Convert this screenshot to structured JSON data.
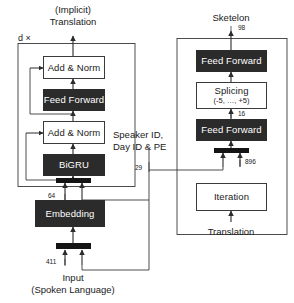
{
  "figure": {
    "background_color": "#ffffff",
    "dark_block_color": "#2b2b2b",
    "light_block_color": "#ffffff",
    "line_color": "#3a3a3a"
  },
  "left_branch": {
    "output_caption_line1": "(Implicit)",
    "output_caption_line2": "Translation",
    "repeat_caption": "d ×",
    "blocks": [
      {
        "label": "Add & Norm",
        "style": "light"
      },
      {
        "label": "Feed Forward",
        "style": "dark"
      },
      {
        "label": "Add & Norm",
        "style": "light"
      },
      {
        "label": "BiGRU",
        "style": "dark"
      },
      {
        "label": "",
        "style": "bar"
      }
    ],
    "embedding_label": "Embedding",
    "input_bar_label": "",
    "input_caption_line1": "Input",
    "input_caption_line2": "(Spoken Language)",
    "dim_embedding_out": "64",
    "dim_input": "411"
  },
  "right_branch": {
    "output_caption": "Sketelon",
    "blocks": [
      {
        "label": "Feed Forward",
        "sublabel": "",
        "style": "dark"
      },
      {
        "label": "Splicing",
        "sublabel": "(-5, …, +5)",
        "style": "light"
      },
      {
        "label": "Feed Forward",
        "sublabel": "",
        "style": "dark"
      },
      {
        "label": "",
        "sublabel": "",
        "style": "bar"
      },
      {
        "label": "Iteration",
        "sublabel": "",
        "style": "light"
      }
    ],
    "input_caption": "Translation",
    "dim_output": "98",
    "dim_splicing_out": "16",
    "dim_iteration_out": "896"
  },
  "side_condition": {
    "line1": "Speaker ID,",
    "line2": "Day ID & PE",
    "dim": "29"
  }
}
